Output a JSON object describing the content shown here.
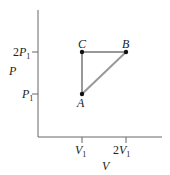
{
  "diagram": {
    "type": "PV diagram",
    "axes": {
      "x_label": "V",
      "y_label": "P",
      "x_ticks": [
        {
          "label_main": "V",
          "label_coef": "",
          "label_sub": "1"
        },
        {
          "label_main": "V",
          "label_coef": "2",
          "label_sub": "1"
        }
      ],
      "y_ticks": [
        {
          "label_main": "P",
          "label_coef": "",
          "label_sub": "1"
        },
        {
          "label_main": "P",
          "label_coef": "2",
          "label_sub": "1"
        }
      ]
    },
    "points": [
      {
        "name": "A",
        "v": "V1",
        "p": "P1"
      },
      {
        "name": "B",
        "v": "2V1",
        "p": "2P1"
      },
      {
        "name": "C",
        "v": "V1",
        "p": "2P1"
      }
    ],
    "paths": [
      {
        "from": "A",
        "to": "B"
      },
      {
        "from": "B",
        "to": "C"
      },
      {
        "from": "C",
        "to": "A"
      }
    ],
    "colors": {
      "axis": "#555555",
      "path": "#999999",
      "point": "#111111"
    }
  }
}
